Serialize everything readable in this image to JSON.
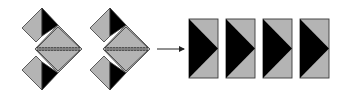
{
  "diagram": {
    "colors": {
      "fill_grey": "#b4b4b4",
      "fill_black": "#000000",
      "stroke": "#3a3a3a",
      "background": "#ffffff",
      "arrow": "#222222"
    },
    "folded_units": [
      {
        "id": "unit-1",
        "offset_x": 0
      },
      {
        "id": "unit-2",
        "offset_x": 68
      }
    ],
    "arrow": {
      "x1": 157,
      "x2": 184,
      "y": 49
    },
    "rectangles": [
      {
        "id": "rect-1",
        "x": 189,
        "y": 19,
        "w": 29,
        "h": 59
      },
      {
        "id": "rect-2",
        "x": 226,
        "y": 19,
        "w": 29,
        "h": 59
      },
      {
        "id": "rect-3",
        "x": 263,
        "y": 19,
        "w": 29,
        "h": 59
      },
      {
        "id": "rect-4",
        "x": 300,
        "y": 19,
        "w": 29,
        "h": 59
      }
    ]
  }
}
